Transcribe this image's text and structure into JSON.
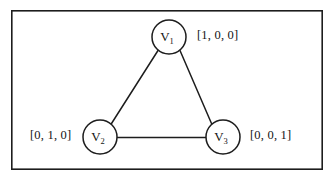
{
  "figure": {
    "background_color": "#ffffff",
    "line_color": "#1d1d1d",
    "frame": {
      "name": "figure-border",
      "x": 11,
      "y": 10,
      "width": 312,
      "height": 160
    }
  },
  "graph": {
    "nodes": [
      {
        "id": "v1",
        "symbol": "V",
        "subscript": "1",
        "cx": 169,
        "cy": 37,
        "r": 17
      },
      {
        "id": "v2",
        "symbol": "V",
        "subscript": "2",
        "cx": 100,
        "cy": 137,
        "r": 17
      },
      {
        "id": "v3",
        "symbol": "V",
        "subscript": "3",
        "cx": 223,
        "cy": 137,
        "r": 17
      }
    ],
    "edges": [
      {
        "id": "e12",
        "from": "v1",
        "to": "v2"
      },
      {
        "id": "e13",
        "from": "v1",
        "to": "v3"
      },
      {
        "id": "e23",
        "from": "v2",
        "to": "v3"
      }
    ],
    "vector_labels": [
      {
        "id": "label-v1",
        "node": "v1",
        "text": "[1, 0, 0]"
      },
      {
        "id": "label-v2",
        "node": "v2",
        "text": "[0, 1, 0]"
      },
      {
        "id": "label-v3",
        "node": "v3",
        "text": "[0, 0, 1]"
      }
    ]
  }
}
